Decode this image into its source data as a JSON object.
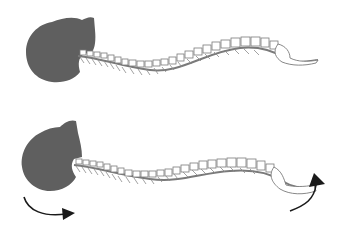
{
  "figure": {
    "colors": {
      "skull": "#5f5f5f",
      "spine_outline": "#7a7a7a",
      "vertebra_fill": "#ffffff",
      "arrow": "#1a1a1a",
      "background": "#ffffff"
    },
    "panels": [
      {
        "id": "top",
        "label": "neutral-posture",
        "arrows": []
      },
      {
        "id": "bottom",
        "label": "rotated-posture",
        "arrows": [
          "skull-rotation-arrow",
          "tail-rotation-arrow"
        ]
      }
    ]
  }
}
